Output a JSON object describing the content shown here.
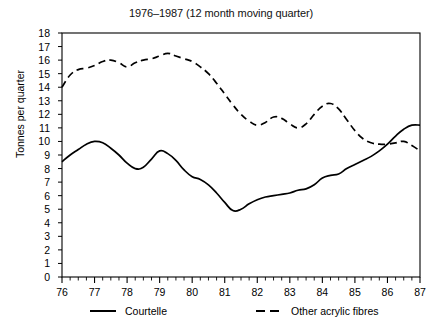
{
  "chart_data": {
    "type": "line",
    "title": "1976–1987 (12 month moving quarter)",
    "xlabel": "",
    "ylabel": "Tonnes per quarter",
    "xlim": [
      76,
      87
    ],
    "ylim": [
      0,
      18
    ],
    "grid": false,
    "legend_position": "below-plot",
    "x_tick_labels": [
      "76",
      "77",
      "78",
      "79",
      "80",
      "81",
      "82",
      "83",
      "84",
      "85",
      "86",
      "87"
    ],
    "x_tick_values": [
      76,
      77,
      78,
      79,
      80,
      81,
      82,
      83,
      84,
      85,
      86,
      87
    ],
    "x_minor_ticks_per_interval": 4,
    "y_tick_labels": [
      "0",
      "1",
      "2",
      "3",
      "4",
      "5",
      "6",
      "7",
      "8",
      "9",
      "10",
      "11",
      "12",
      "13",
      "14",
      "15",
      "16",
      "17",
      "18"
    ],
    "y_tick_values": [
      0,
      1,
      2,
      3,
      4,
      5,
      6,
      7,
      8,
      9,
      10,
      11,
      12,
      13,
      14,
      15,
      16,
      17,
      18
    ],
    "x": [
      76.0,
      76.25,
      76.5,
      76.75,
      77.0,
      77.25,
      77.5,
      77.75,
      78.0,
      78.25,
      78.5,
      78.75,
      79.0,
      79.25,
      79.5,
      79.75,
      80.0,
      80.25,
      80.5,
      80.75,
      81.0,
      81.25,
      81.5,
      81.75,
      82.0,
      82.25,
      82.5,
      82.75,
      83.0,
      83.25,
      83.5,
      83.75,
      84.0,
      84.25,
      84.5,
      84.75,
      85.0,
      85.25,
      85.5,
      85.75,
      86.0,
      86.25,
      86.5,
      86.75,
      87.0
    ],
    "series": [
      {
        "name": "Courtelle",
        "style": "solid",
        "color": "#000000",
        "values": [
          8.5,
          9.0,
          9.4,
          9.8,
          10.0,
          9.9,
          9.5,
          9.0,
          8.4,
          8.0,
          8.1,
          8.7,
          9.3,
          9.1,
          8.6,
          7.9,
          7.4,
          7.2,
          6.8,
          6.2,
          5.5,
          4.9,
          5.0,
          5.4,
          5.7,
          5.9,
          6.0,
          6.1,
          6.2,
          6.4,
          6.5,
          6.8,
          7.3,
          7.5,
          7.6,
          8.0,
          8.3,
          8.6,
          8.9,
          9.3,
          9.8,
          10.4,
          10.9,
          11.2,
          11.2
        ]
      },
      {
        "name": "Other acrylic fibres",
        "style": "dashed",
        "color": "#000000",
        "values": [
          14.0,
          14.9,
          15.3,
          15.4,
          15.6,
          15.9,
          16.0,
          15.8,
          15.5,
          15.8,
          16.0,
          16.1,
          16.3,
          16.5,
          16.3,
          16.1,
          15.9,
          15.5,
          15.0,
          14.3,
          13.5,
          12.7,
          12.0,
          11.5,
          11.2,
          11.4,
          11.8,
          11.7,
          11.3,
          11.0,
          11.3,
          12.0,
          12.6,
          12.8,
          12.4,
          11.6,
          10.8,
          10.2,
          9.9,
          9.8,
          9.8,
          9.9,
          10.0,
          9.7,
          9.3
        ]
      }
    ]
  },
  "legend": {
    "entries": [
      {
        "label": "Courtelle",
        "style": "solid"
      },
      {
        "label": "Other acrylic fibres",
        "style": "dashed"
      }
    ]
  }
}
